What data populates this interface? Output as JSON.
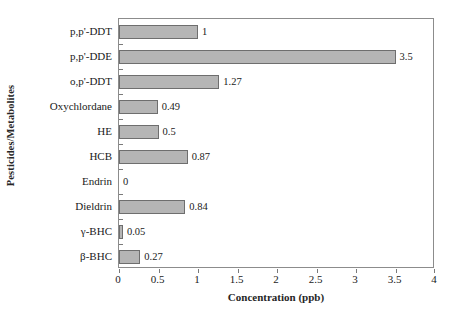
{
  "chart_data": {
    "type": "bar",
    "orientation": "horizontal",
    "title": "",
    "xlabel": "Concentration (ppb)",
    "ylabel": "Pesticides/Metabolites",
    "categories": [
      "p,p'-DDT",
      "p,p'-DDE",
      "o,p'-DDT",
      "Oxychlordane",
      "HE",
      "HCB",
      "Endrin",
      "Dieldrin",
      "γ-BHC",
      "β-BHC"
    ],
    "values": [
      1,
      3.5,
      1.27,
      0.49,
      0.5,
      0.87,
      0,
      0.84,
      0.05,
      0.27
    ],
    "value_labels": [
      "1",
      "3.5",
      "1.27",
      "0.49",
      "0.5",
      "0.87",
      "0",
      "0.84",
      "0.05",
      "0.27"
    ],
    "xlim": [
      0,
      4
    ],
    "xticks": [
      0,
      0.5,
      1,
      1.5,
      2,
      2.5,
      3,
      3.5,
      4
    ],
    "xticklabels": [
      "0",
      "0.5",
      "1",
      "1.5",
      "2",
      "2.5",
      "3",
      "3.5",
      "4"
    ],
    "grid": false,
    "legend": null,
    "bar_color": "#b5b5b5",
    "bar_edge_color": "#6e6e6e",
    "axis_color": "#8c8c8c",
    "background": "#ffffff"
  }
}
